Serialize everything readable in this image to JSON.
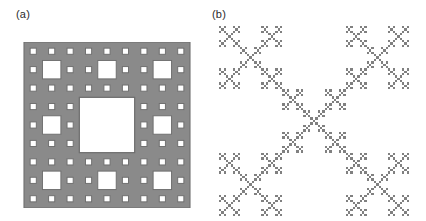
{
  "figure": {
    "background_color": "#ffffff",
    "width": 426,
    "height": 221
  },
  "panels": [
    {
      "id": "panel-a",
      "label": "(a)",
      "caption": "(a)",
      "figure_type": "Sierpinski carpet",
      "fill_color": "#8a8a8a",
      "hole_color": "#ffffff",
      "outline_color": "#6e6e6e",
      "iterations": 3,
      "base_grid": 3,
      "x": 22,
      "y": 42,
      "size": 170
    },
    {
      "id": "panel-b",
      "label": "(b)",
      "caption": "(b)",
      "figure_type": "diagonal cross fractal",
      "fill_color": "#808080",
      "hole_color": "#ffffff",
      "iterations": 4,
      "base_grid": 3,
      "cell_size": 5,
      "x": 218,
      "y": 26,
      "size": 190
    }
  ],
  "chart_data": {
    "type": "diagram",
    "title": "",
    "subtitle": "",
    "panels": [
      {
        "label": "(a)",
        "name": "Sierpinski carpet",
        "rule": "3x3 subdivision, remove center square, recurse on remaining 8",
        "levels": 3,
        "solid_cells_level1": 8,
        "solid_cells_level2": 64,
        "solid_cells_level3": 512,
        "fractal_dimension": 1.8928,
        "fill_color": "#8a8a8a",
        "hole_color": "#ffffff"
      },
      {
        "label": "(b)",
        "name": "Diagonal cross (saltire) fractal",
        "rule": "3x3 subdivision, keep center and four diagonal corners, recurse",
        "levels": 4,
        "solid_cells_level1": 5,
        "solid_cells_level2": 25,
        "solid_cells_level3": 125,
        "solid_cells_level4": 625,
        "fractal_dimension": 1.465,
        "fill_color": "#808080",
        "hole_color": "#ffffff"
      }
    ],
    "xlabel": "",
    "ylabel": "",
    "legend": [],
    "grid": false
  }
}
